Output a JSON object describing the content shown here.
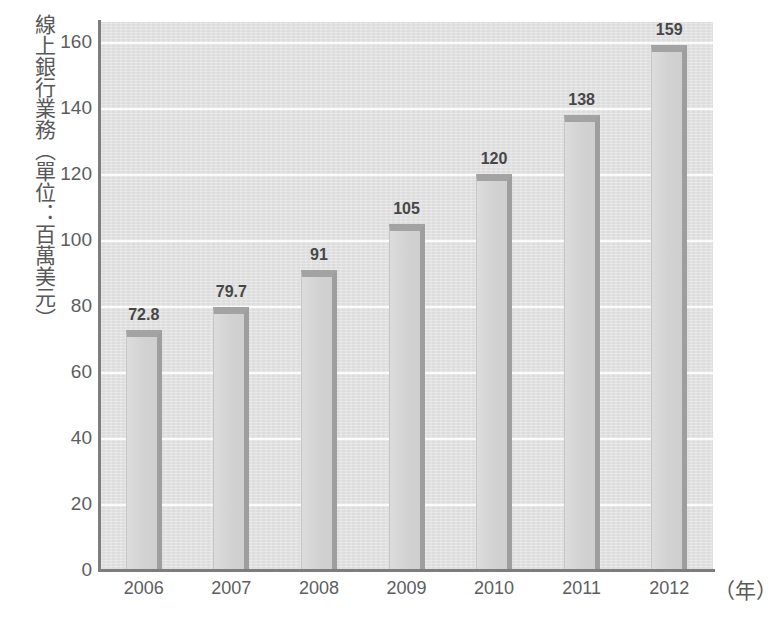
{
  "chart_data": {
    "type": "bar",
    "title": "",
    "subtitle": "",
    "xlabel": "（年）",
    "ylabel": "線上銀行業務（單位：百萬美元）",
    "categories": [
      "2006",
      "2007",
      "2008",
      "2009",
      "2010",
      "2011",
      "2012"
    ],
    "values": [
      72.8,
      79.7,
      91,
      105,
      120,
      138,
      159
    ],
    "value_labels": [
      "72.8",
      "79.7",
      "91",
      "105",
      "120",
      "138",
      "159"
    ],
    "series": [
      {
        "name": "線上銀行業務",
        "values": [
          72.8,
          79.7,
          91,
          105,
          120,
          138,
          159
        ]
      }
    ],
    "ylim": [
      0,
      160
    ],
    "xlim_categories": 7,
    "y_ticks": [
      0,
      20,
      40,
      60,
      80,
      100,
      120,
      140,
      160
    ],
    "y_tick_labels": [
      "0",
      "20",
      "40",
      "60",
      "80",
      "100",
      "120",
      "140",
      "160"
    ],
    "grid": true,
    "grid_axis": "y",
    "legend": false,
    "legend_position": "none",
    "colors": {
      "plot_background": "#e3e3e3",
      "gridline": "#fbfbfb",
      "bar_fill": "#d6d6d6",
      "bar_top_shadow": "#a3a3a3",
      "bar_right_shadow": "#9e9e9e",
      "axis_line": "#7d7d7f",
      "tick_text": "#5d5d5f",
      "data_label_text": "#474749",
      "page_background": "#ffffff"
    }
  },
  "axis": {
    "y_title": "線上銀行業務（單位：百萬美元）",
    "x_unit": "（年）"
  }
}
